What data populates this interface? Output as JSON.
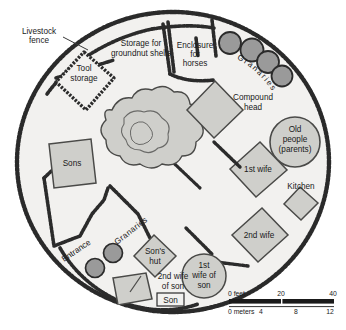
{
  "figure": {
    "kind": "compound-plan-map",
    "background_color": "#ffffff",
    "compound_fill": "#f2f1ef",
    "structure_fill": "#cfcfcb",
    "granary_fill": "#9a9a9a",
    "fence_color": "#2b2b2b",
    "text_color": "#1a1a1a"
  },
  "annotations": {
    "livestock_fence": "Livestock\nfence",
    "tool_storage": "Tool\nstorage",
    "groundnut": "Storage for\ngroundnut shells",
    "horses": "Enclosure\nfor\nhorses",
    "granaries_top": "Granaries",
    "compound_head": "Compound\nhead",
    "old_people": "Old\npeople\n(parents)",
    "first_wife": "1st wife",
    "kitchen": "Kitchen",
    "second_wife": "2nd wife",
    "sons": "Sons",
    "entrance": "Entrance",
    "granaries_bottom": "Granaries",
    "sons_hut": "Son's\nhut",
    "second_wife_of_son": "2nd wife\nof son",
    "son": "Son",
    "first_wife_of_son": "1st\nwife of\nson"
  },
  "labels": {
    "livestock_fence_l1": "Livestock",
    "livestock_fence_l2": "fence",
    "tool_storage_l1": "Tool",
    "tool_storage_l2": "storage",
    "groundnut_l1": "Storage for",
    "groundnut_l2": "groundnut shells",
    "horses_l1": "Enclosure",
    "horses_l2": "for",
    "horses_l3": "horses",
    "granaries_top": "Granaries",
    "compound_head_l1": "Compound",
    "compound_head_l2": "head",
    "old_people_l1": "Old",
    "old_people_l2": "people",
    "old_people_l3": "(parents)",
    "first_wife": "1st wife",
    "kitchen": "Kitchen",
    "second_wife": "2nd wife",
    "sons": "Sons",
    "entrance": "Entrance",
    "granaries_bottom": "Granaries",
    "sons_hut_l1": "Son's",
    "sons_hut_l2": "hut",
    "second_wife_of_son_l1": "2nd wife",
    "second_wife_of_son_l2": "of son",
    "son": "Son",
    "first_wife_of_son_l1": "1st",
    "first_wife_of_son_l2": "wife of",
    "first_wife_of_son_l3": "son"
  },
  "scale_bar": {
    "feet_label": "0 feet",
    "feet_ticks": [
      "20",
      "40"
    ],
    "meters_label": "0 meters",
    "meters_ticks": [
      "4",
      "8",
      "12"
    ]
  }
}
